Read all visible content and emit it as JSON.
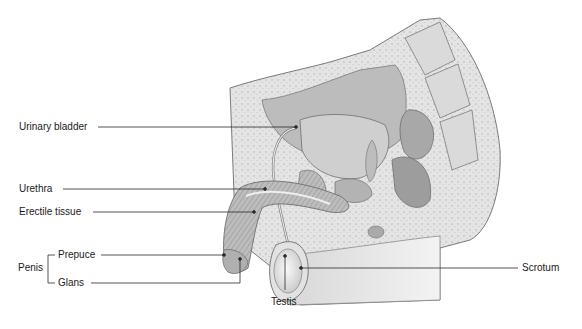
{
  "figure": {
    "labels": {
      "urinary_bladder": "Urinary bladder",
      "urethra": "Urethra",
      "erectile_tissue": "Erectile tissue",
      "penis": "Penis",
      "prepuce": "Prepuce",
      "glans": "Glans",
      "testis": "Testis",
      "scrotum": "Scrotum"
    },
    "colors": {
      "line": "#2a2a2a",
      "tissue_light": "#e6e6e6",
      "tissue_mid": "#c8c8c8",
      "tissue_dark": "#9a9a9a",
      "outline": "#6e6e6e"
    }
  }
}
